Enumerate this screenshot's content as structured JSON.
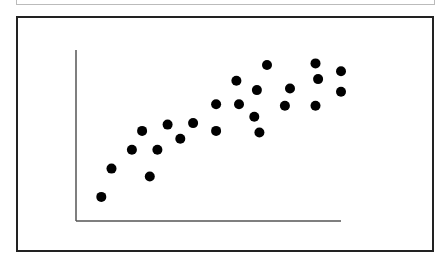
{
  "chart_data": {
    "type": "scatter",
    "title": "",
    "xlabel": "",
    "ylabel": "",
    "grid": false,
    "legend": null,
    "xlim": [
      0,
      100
    ],
    "ylim": [
      0,
      100
    ],
    "points": [
      {
        "x": 6,
        "y": 9
      },
      {
        "x": 10,
        "y": 27
      },
      {
        "x": 18,
        "y": 39
      },
      {
        "x": 22,
        "y": 51
      },
      {
        "x": 25,
        "y": 22
      },
      {
        "x": 28,
        "y": 39
      },
      {
        "x": 32,
        "y": 55
      },
      {
        "x": 37,
        "y": 46
      },
      {
        "x": 42,
        "y": 56
      },
      {
        "x": 51,
        "y": 68
      },
      {
        "x": 51,
        "y": 51
      },
      {
        "x": 60,
        "y": 68
      },
      {
        "x": 59,
        "y": 83
      },
      {
        "x": 67,
        "y": 77
      },
      {
        "x": 66,
        "y": 60
      },
      {
        "x": 68,
        "y": 50
      },
      {
        "x": 71,
        "y": 93
      },
      {
        "x": 78,
        "y": 67
      },
      {
        "x": 80,
        "y": 78
      },
      {
        "x": 90,
        "y": 94
      },
      {
        "x": 91,
        "y": 84
      },
      {
        "x": 90,
        "y": 67
      },
      {
        "x": 100,
        "y": 89
      },
      {
        "x": 100,
        "y": 76
      }
    ]
  },
  "colors": {
    "point": "#000000",
    "axis": "#555555",
    "frame": "#222222"
  }
}
